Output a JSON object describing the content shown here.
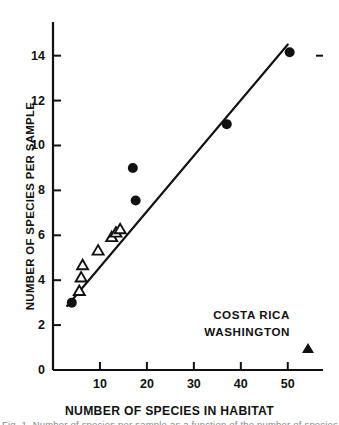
{
  "figure": {
    "caption_fragment": "Fig. 1.  Number of species per sample as a function of the number of species in the habitat"
  },
  "chart_data": {
    "type": "scatter",
    "title": "",
    "xlabel": "NUMBER OF SPECIES IN HABITAT",
    "ylabel": "NUMBER OF SPECIES PER SAMPLE",
    "xlim": [
      0,
      57.5
    ],
    "ylim": [
      0,
      15.5
    ],
    "grid": false,
    "legend_position": "inside-lower-right",
    "xticks": [
      10,
      20,
      30,
      40,
      50
    ],
    "xtick_labels": [
      "10",
      "20",
      "30",
      "40",
      "50"
    ],
    "yticks": [
      0,
      2,
      4,
      6,
      8,
      10,
      12,
      14
    ],
    "ytick_labels": [
      "0",
      "2",
      "4",
      "6",
      "8",
      "10",
      "12",
      "14"
    ],
    "series": [
      {
        "name": "COSTA RICA",
        "marker": "filled-circle",
        "color": "#111111",
        "points": [
          {
            "x": 4.0,
            "y": 3.0
          },
          {
            "x": 17.0,
            "y": 9.0
          },
          {
            "x": 17.6,
            "y": 7.55
          },
          {
            "x": 37.0,
            "y": 10.95
          },
          {
            "x": 50.4,
            "y": 14.15
          }
        ]
      },
      {
        "name": "WASHINGTON",
        "marker": "open-triangle",
        "color": "#111111",
        "points": [
          {
            "x": 5.6,
            "y": 3.5
          },
          {
            "x": 6.0,
            "y": 4.1
          },
          {
            "x": 6.3,
            "y": 4.65
          },
          {
            "x": 9.6,
            "y": 5.3
          },
          {
            "x": 12.5,
            "y": 5.9
          },
          {
            "x": 13.4,
            "y": 6.1
          },
          {
            "x": 14.3,
            "y": 6.25
          }
        ]
      }
    ],
    "fit_line": {
      "name": "regression-line",
      "x0": 3.0,
      "y0": 2.85,
      "x1": 50.0,
      "y1": 14.5
    }
  },
  "legend": {
    "rows": [
      {
        "label": "COSTA RICA",
        "marker": "filled-circle"
      },
      {
        "label": "WASHINGTON",
        "marker": "open-triangle"
      }
    ]
  }
}
